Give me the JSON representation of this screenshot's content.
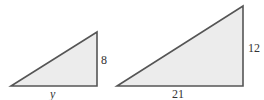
{
  "diagram": {
    "colors": {
      "fill": "#ececec",
      "stroke": "#555555",
      "text": "#333333"
    },
    "triangles": [
      {
        "name": "small-triangle",
        "points": [
          [
            11,
            86
          ],
          [
            97,
            86
          ],
          [
            97,
            32
          ]
        ],
        "labels": {
          "vertical_side": "8",
          "base": "y"
        }
      },
      {
        "name": "large-triangle",
        "points": [
          [
            117,
            86
          ],
          [
            243,
            86
          ],
          [
            243,
            6
          ]
        ],
        "labels": {
          "vertical_side": "12",
          "base": "21"
        }
      }
    ]
  }
}
